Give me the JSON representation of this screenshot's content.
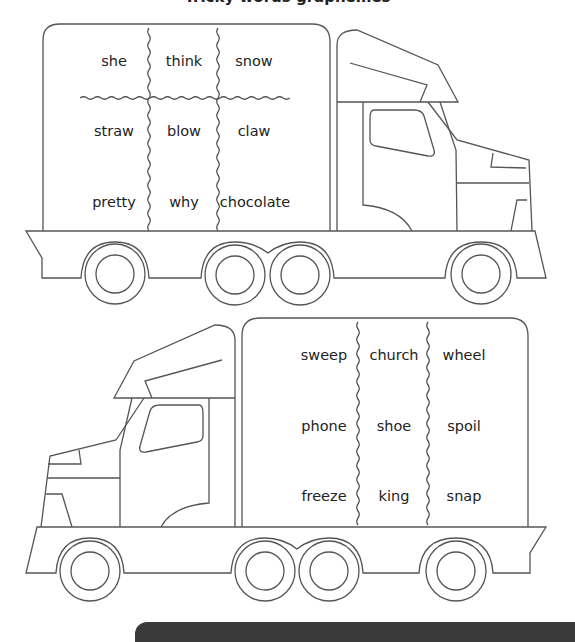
{
  "header": {
    "title": "Tricky words graphemes"
  },
  "trucks": [
    {
      "grid": [
        [
          "she",
          "think",
          "snow"
        ],
        [
          "straw",
          "blow",
          "claw"
        ],
        [
          "pretty",
          "why",
          "chocolate"
        ]
      ]
    },
    {
      "grid": [
        [
          "sweep",
          "church",
          "wheel"
        ],
        [
          "phone",
          "shoe",
          "spoil"
        ],
        [
          "freeze",
          "king",
          "snap"
        ]
      ]
    }
  ],
  "colors": {
    "line": "#555555",
    "text": "#222222",
    "bar": "#3a3a3a"
  }
}
